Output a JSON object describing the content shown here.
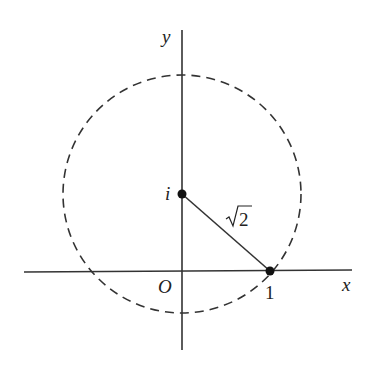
{
  "diagram": {
    "axes": {
      "x_label": "x",
      "y_label": "y",
      "origin_label": "O"
    },
    "points": [
      {
        "name": "i",
        "label": "i",
        "x": 0,
        "y": 1
      },
      {
        "name": "one",
        "label": "1",
        "x": 1,
        "y": 0
      }
    ],
    "segment_label": "√2",
    "segment_label_radicand": "2",
    "circle": {
      "center": "i",
      "radius": "√2",
      "style": "dashed"
    }
  }
}
